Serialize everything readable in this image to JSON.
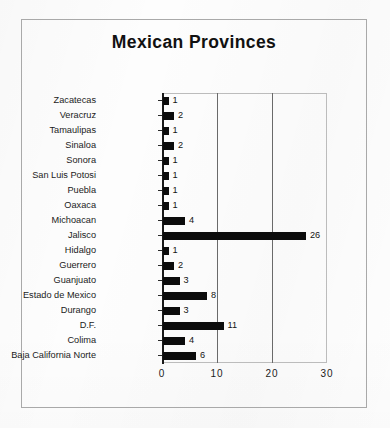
{
  "figure": {
    "title": "Mexican Provinces",
    "background_color": "#fdfdfd",
    "frame_color": "#a9a9a9",
    "bar_color": "#0c0c0c",
    "gridline_color": "#6a6a6a",
    "axis_color": "#1a1a1a"
  },
  "chart_data": {
    "type": "bar",
    "orientation": "horizontal",
    "title": "Mexican Provinces",
    "xlabel": "",
    "ylabel": "",
    "xlim": [
      0,
      30
    ],
    "xticks": [
      "0",
      "10",
      "20",
      "30"
    ],
    "xtick_values": [
      0,
      10,
      20,
      30
    ],
    "grid": true,
    "grid_axis": "x",
    "legend": false,
    "data_labels": true,
    "categories": [
      "Zacatecas",
      "Veracruz",
      "Tamaulipas",
      "Sinaloa",
      "Sonora",
      "San Luis Potosi",
      "Puebla",
      "Oaxaca",
      "Michoacan",
      "Jalisco",
      "Hidalgo",
      "Guerrero",
      "Guanjuato",
      "Estado de Mexico",
      "Durango",
      "D.F.",
      "Colima",
      "Baja California  Norte"
    ],
    "values": [
      1,
      2,
      1,
      2,
      1,
      1,
      1,
      1,
      4,
      26,
      1,
      2,
      3,
      8,
      3,
      11,
      4,
      6
    ],
    "value_labels": [
      "1",
      "2",
      "1",
      "2",
      "1",
      "1",
      "1",
      "1",
      "4",
      "26",
      "1",
      "2",
      "3",
      "8",
      "3",
      "11",
      "4",
      "6"
    ]
  }
}
